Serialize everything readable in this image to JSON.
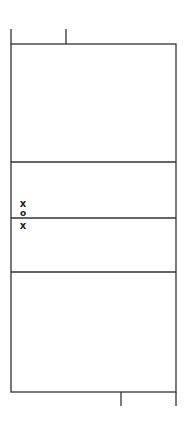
{
  "diagram": {
    "type": "court-layout",
    "line_color": "#333333",
    "background": "#ffffff",
    "court": {
      "left": 11,
      "right": 176,
      "top": 44,
      "bottom": 392
    },
    "dividers_y": [
      162,
      218,
      272
    ],
    "stubs": [
      {
        "x": 11,
        "y1": 29,
        "y2": 44
      },
      {
        "x": 66,
        "y1": 29,
        "y2": 44
      },
      {
        "x": 121,
        "y1": 392,
        "y2": 406
      },
      {
        "x": 176,
        "y1": 392,
        "y2": 406
      }
    ],
    "markers": [
      {
        "symbol": "x",
        "label": "x",
        "x": 23,
        "y": 204
      },
      {
        "symbol": "o",
        "label": "o",
        "x": 23,
        "y": 213
      },
      {
        "symbol": "x",
        "label": "x",
        "x": 23,
        "y": 226
      }
    ]
  }
}
